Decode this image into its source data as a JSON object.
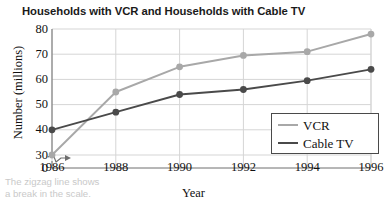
{
  "chart_data": {
    "type": "line",
    "title": "Households with VCR and Households with Cable TV",
    "xlabel": "Year",
    "ylabel": "Number (millions)",
    "categories": [
      1986,
      1988,
      1990,
      1992,
      1994,
      1996
    ],
    "x_tick_labels": [
      "1986",
      "1988",
      "1990",
      "1992",
      "1994",
      "1996"
    ],
    "y_tick_labels": [
      "0",
      "30",
      "40",
      "50",
      "60",
      "70",
      "80"
    ],
    "y_tick_values": [
      0,
      30,
      40,
      50,
      60,
      70,
      80
    ],
    "ylim": [
      30,
      80
    ],
    "xlim": [
      1986,
      1996
    ],
    "grid": true,
    "axis_break": true,
    "axis_break_note": "zigzag break between 0 and 30 on the y-axis",
    "legend_position": "lower right",
    "series": [
      {
        "name": "VCR",
        "color": "#a8a8a8",
        "marker": "circle",
        "values": [
          30,
          55,
          65,
          69.5,
          71,
          78
        ]
      },
      {
        "name": "Cable TV",
        "color": "#4a4a4a",
        "marker": "circle",
        "values": [
          40,
          47,
          54,
          56,
          59.5,
          64
        ]
      }
    ],
    "caption": "The zigzag line shows a break in the scale.",
    "caption_line1": "The zigzag line shows",
    "caption_line2": "a break in the scale.",
    "colors": {
      "vcr": "#a8a8a8",
      "cable_tv": "#4a4a4a",
      "grid": "#d5d5d5",
      "axis": "#6e6e6e",
      "caption": "#c9c9c9",
      "text": "#111111",
      "background": "#ffffff"
    }
  }
}
